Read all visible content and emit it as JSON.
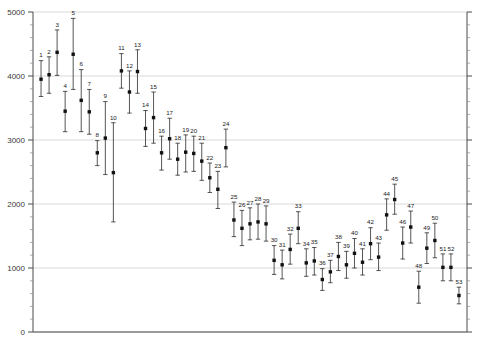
{
  "chart_data": {
    "type": "scatter",
    "title": "",
    "subtitle": "",
    "xlabel": "",
    "ylabel": "",
    "xlim": [
      0,
      54
    ],
    "ylim": [
      0,
      5000
    ],
    "grid": true,
    "grid_axis": "y",
    "legend": "none",
    "y_ticks": [
      0,
      1000,
      2000,
      3000,
      4000,
      5000
    ],
    "y_tick_labels": [
      "0",
      "1000",
      "2000",
      "3000",
      "4000",
      "5000"
    ],
    "y_minor_tick_interval": 200,
    "x_axis_visible": true,
    "x_tick_labels": [],
    "series": [
      {
        "name": "estimate",
        "marker": "filled-square",
        "error_bars": "vertical",
        "point_labels": [
          "1",
          "2",
          "3",
          "4",
          "5",
          "6",
          "7",
          "8",
          "9",
          "10",
          "11",
          "12",
          "13",
          "14",
          "15",
          "16",
          "17",
          "18",
          "19",
          "20",
          "21",
          "22",
          "23",
          "24",
          "25",
          "26",
          "27",
          "28",
          "29",
          "30",
          "31",
          "32",
          "33",
          "34",
          "35",
          "36",
          "37",
          "38",
          "39",
          "40",
          "41",
          "42",
          "43",
          "44",
          "45",
          "46",
          "47",
          "48",
          "49",
          "50",
          "51",
          "52",
          "53"
        ],
        "x": [
          1,
          2,
          3,
          4,
          5,
          6,
          7,
          8,
          9,
          10,
          11,
          12,
          13,
          14,
          15,
          16,
          17,
          18,
          19,
          20,
          21,
          22,
          23,
          24,
          25,
          26,
          27,
          28,
          29,
          30,
          31,
          32,
          33,
          34,
          35,
          36,
          37,
          38,
          39,
          40,
          41,
          42,
          43,
          44,
          45,
          46,
          47,
          48,
          49,
          50,
          51,
          52,
          53
        ],
        "values": [
          3950,
          4020,
          4370,
          3450,
          4340,
          3620,
          3440,
          2800,
          3030,
          2490,
          4080,
          3750,
          4070,
          3180,
          3350,
          2800,
          3020,
          2700,
          2810,
          2790,
          2670,
          2410,
          2230,
          2880,
          1750,
          1620,
          1690,
          1720,
          1690,
          1120,
          1050,
          1290,
          1620,
          1080,
          1110,
          820,
          940,
          1180,
          1050,
          1230,
          1090,
          1380,
          1170,
          1830,
          2070,
          1390,
          1640,
          700,
          1310,
          1430,
          1010,
          1010,
          570
        ],
        "lower": [
          3680,
          3730,
          4010,
          3130,
          3790,
          3130,
          3090,
          2600,
          2460,
          1720,
          3810,
          3420,
          3730,
          2900,
          2950,
          2530,
          2700,
          2450,
          2500,
          2510,
          2370,
          2180,
          1930,
          2580,
          1490,
          1350,
          1440,
          1450,
          1420,
          900,
          830,
          1060,
          1380,
          870,
          890,
          650,
          770,
          960,
          840,
          1000,
          890,
          1130,
          960,
          1590,
          1840,
          1140,
          1390,
          450,
          1070,
          1160,
          800,
          800,
          440
        ],
        "upper": [
          4240,
          4300,
          4720,
          3760,
          4900,
          4100,
          3790,
          2990,
          3600,
          3270,
          4350,
          4080,
          4410,
          3460,
          3750,
          3060,
          3340,
          2950,
          3080,
          3060,
          2950,
          2640,
          2510,
          3170,
          2030,
          1900,
          1940,
          2000,
          1970,
          1350,
          1280,
          1530,
          1880,
          1300,
          1320,
          990,
          1120,
          1400,
          1260,
          1460,
          1300,
          1630,
          1390,
          2080,
          2310,
          1640,
          1890,
          950,
          1550,
          1700,
          1220,
          1220,
          700
        ]
      }
    ]
  }
}
